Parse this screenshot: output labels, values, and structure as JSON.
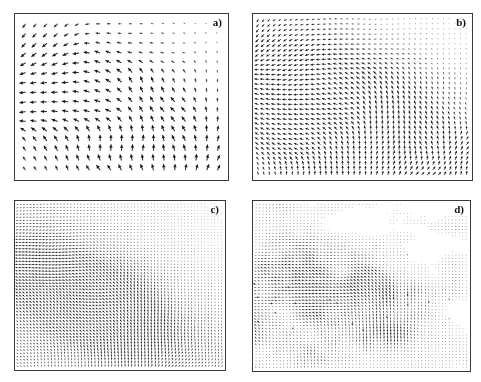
{
  "figure": {
    "type": "vector-field-quiver-grid",
    "layout": "2x2",
    "background_color": "#ffffff",
    "border_color": "#3a3a3a",
    "arrow_color": "#1a1a1a",
    "width": 481,
    "height": 382
  },
  "panels": [
    {
      "id": "a",
      "label": "a)",
      "name": "panel-a",
      "grid_cols": 19,
      "grid_rows": 16,
      "spacing": 11.0,
      "arrow_scale": 3.4,
      "density": "coarse",
      "description": "Sparse uniform grid of short vectors; magnitudes decay toward the upper-right corner leaving that region nearly blank.",
      "seed": 11,
      "core_x": 0.42,
      "core_y": 0.62,
      "core_radius": 0.46,
      "boundary_bias": 0.88,
      "edge_noise": 0.0,
      "streaks": false
    },
    {
      "id": "b",
      "label": "b)",
      "name": "panel-b",
      "grid_cols": 38,
      "grid_rows": 32,
      "spacing": 5.6,
      "arrow_scale": 2.3,
      "density": "medium",
      "description": "Denser grid; a diagonal front runs from the upper-right to the lower-right, vectors fading out beyond it.",
      "seed": 23,
      "core_x": 0.4,
      "core_y": 0.62,
      "core_radius": 0.52,
      "boundary_bias": 0.8,
      "edge_noise": 0.06,
      "streaks": false
    },
    {
      "id": "c",
      "label": "c)",
      "name": "panel-c",
      "grid_cols": 62,
      "grid_rows": 52,
      "spacing": 3.3,
      "arrow_scale": 1.7,
      "density": "fine",
      "description": "Fine grid filling the frame with a smooth stepped diagonal boundary and a dark high-magnitude core left of centre.",
      "seed": 37,
      "core_x": 0.36,
      "core_y": 0.6,
      "core_radius": 0.34,
      "boundary_bias": 0.74,
      "edge_noise": 0.05,
      "streaks": false
    },
    {
      "id": "d",
      "label": "d)",
      "name": "panel-d",
      "grid_cols": 62,
      "grid_rows": 52,
      "spacing": 3.4,
      "arrow_scale": 1.7,
      "density": "fine",
      "description": "Same fine grid but the active region is a ragged diagonal blob with a fragmented fractal edge and dark horizontal streaks through the core.",
      "seed": 53,
      "core_x": 0.52,
      "core_y": 0.56,
      "core_radius": 0.3,
      "boundary_bias": 0.4,
      "edge_noise": 0.42,
      "streaks": true
    }
  ],
  "chart_data": {
    "type": "scatter",
    "title": "",
    "xlabel": "",
    "ylabel": "",
    "grid": false,
    "legend": "none",
    "panel_labels": [
      "a)",
      "b)",
      "c)",
      "d)"
    ],
    "series": [
      {
        "name": "a)",
        "grid_cols": 19,
        "grid_rows": 16,
        "vector_count": 304
      },
      {
        "name": "b)",
        "grid_cols": 38,
        "grid_rows": 32,
        "vector_count": 1216
      },
      {
        "name": "c)",
        "grid_cols": 62,
        "grid_rows": 52,
        "vector_count": 3224
      },
      {
        "name": "d)",
        "grid_cols": 62,
        "grid_rows": 52,
        "vector_count": 3224
      }
    ]
  }
}
